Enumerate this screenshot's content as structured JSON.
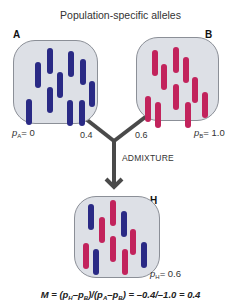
{
  "title": "Population-specific alleles",
  "colors": {
    "allele_a": "#2a2a85",
    "allele_b": "#c2235c",
    "box_fill": "#dde0e6",
    "box_border": "#8b8f97",
    "arrow": "#4a4a4a"
  },
  "populations": {
    "A": {
      "label": "A",
      "freq_symbol": "p",
      "freq_sub": "A",
      "freq_value": "= 0",
      "bars": [
        {
          "x": 25,
          "y": 25,
          "h": 26,
          "c": "a"
        },
        {
          "x": 37,
          "y": 11,
          "h": 26,
          "c": "a"
        },
        {
          "x": 58,
          "y": 14,
          "h": 26,
          "c": "a"
        },
        {
          "x": 70,
          "y": 22,
          "h": 26,
          "c": "a"
        },
        {
          "x": 47,
          "y": 35,
          "h": 26,
          "c": "a"
        },
        {
          "x": 79,
          "y": 44,
          "h": 26,
          "c": "a"
        },
        {
          "x": 37,
          "y": 50,
          "h": 26,
          "c": "a"
        },
        {
          "x": 16,
          "y": 62,
          "h": 26,
          "c": "a"
        },
        {
          "x": 57,
          "y": 63,
          "h": 26,
          "c": "a"
        },
        {
          "x": 69,
          "y": 63,
          "h": 26,
          "c": "a"
        }
      ]
    },
    "B": {
      "label": "B",
      "freq_symbol": "p",
      "freq_sub": "B",
      "freq_value": "= 1.0",
      "bars": [
        {
          "x": 19,
          "y": 16,
          "h": 26,
          "c": "b"
        },
        {
          "x": 40,
          "y": 13,
          "h": 26,
          "c": "b"
        },
        {
          "x": 28,
          "y": 30,
          "h": 26,
          "c": "b"
        },
        {
          "x": 50,
          "y": 23,
          "h": 26,
          "c": "b"
        },
        {
          "x": 59,
          "y": 43,
          "h": 26,
          "c": "b"
        },
        {
          "x": 40,
          "y": 50,
          "h": 26,
          "c": "b"
        },
        {
          "x": 12,
          "y": 62,
          "h": 26,
          "c": "b"
        },
        {
          "x": 22,
          "y": 68,
          "h": 26,
          "c": "b"
        },
        {
          "x": 52,
          "y": 68,
          "h": 26,
          "c": "b"
        },
        {
          "x": 69,
          "y": 58,
          "h": 26,
          "c": "b"
        }
      ]
    },
    "H": {
      "label": "H",
      "freq_symbol": "p",
      "freq_sub": "H",
      "freq_value": "= 0.6",
      "bars": [
        {
          "x": 17,
          "y": 11,
          "h": 26,
          "c": "a"
        },
        {
          "x": 39,
          "y": 7,
          "h": 26,
          "c": "b"
        },
        {
          "x": 28,
          "y": 24,
          "h": 26,
          "c": "b"
        },
        {
          "x": 50,
          "y": 18,
          "h": 26,
          "c": "a"
        },
        {
          "x": 59,
          "y": 36,
          "h": 26,
          "c": "b"
        },
        {
          "x": 39,
          "y": 43,
          "h": 26,
          "c": "b"
        },
        {
          "x": 12,
          "y": 50,
          "h": 26,
          "c": "b"
        },
        {
          "x": 22,
          "y": 56,
          "h": 26,
          "c": "a"
        },
        {
          "x": 51,
          "y": 56,
          "h": 26,
          "c": "b"
        },
        {
          "x": 70,
          "y": 49,
          "h": 26,
          "c": "a"
        }
      ]
    }
  },
  "weights": {
    "from_A": "0.4",
    "from_B": "0.6"
  },
  "admixture_label": "ADMIXTURE",
  "formula": {
    "prefix": "M = (p",
    "s1": "H",
    "m1": "–p",
    "s2": "B",
    "m2": ")/(p",
    "s3": "A",
    "m3": "–p",
    "s4": "B",
    "suffix": ") = –0.4/–1.0 = 0.4"
  }
}
